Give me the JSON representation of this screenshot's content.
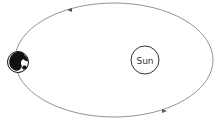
{
  "diagram": {
    "type": "orbit",
    "bodies": [
      {
        "name": "Sun",
        "label": "Sun"
      },
      {
        "name": "Earth",
        "label": ""
      }
    ],
    "orbit_direction": "counterclockwise",
    "colors": {
      "orbit": "#777777",
      "sun_outline": "#333333",
      "earth": "#111111",
      "background": "#ffffff"
    }
  }
}
